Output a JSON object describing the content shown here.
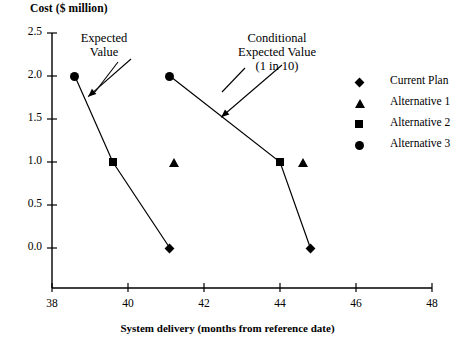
{
  "chart_data": {
    "type": "line",
    "title": "",
    "xlabel": "System delivery (months from reference date)",
    "ylabel": "Cost ($ million)",
    "xlim": [
      38,
      48
    ],
    "ylim": [
      0.0,
      2.5
    ],
    "xticks": [
      38,
      40,
      42,
      44,
      46,
      48
    ],
    "yticks": [
      "0.0",
      "0.5",
      "1.0",
      "1.5",
      "2.0",
      "2.5"
    ],
    "ytick_values": [
      0.0,
      0.5,
      1.0,
      1.5,
      2.0,
      2.5
    ],
    "grid": false,
    "legend_position": "right",
    "legend": [
      {
        "label": "Current Plan",
        "marker": "diamond"
      },
      {
        "label": "Alternative 1",
        "marker": "triangle"
      },
      {
        "label": "Alternative 2",
        "marker": "square"
      },
      {
        "label": "Alternative 3",
        "marker": "circle"
      }
    ],
    "series": [
      {
        "name": "Expected Value",
        "points": [
          {
            "x": 38.6,
            "y": 2.0,
            "marker": "circle",
            "label": "Alternative 3"
          },
          {
            "x": 39.6,
            "y": 1.0,
            "marker": "square",
            "label": "Alternative 2"
          },
          {
            "x": 41.1,
            "y": 0.0,
            "marker": "diamond",
            "label": "Current Plan"
          }
        ]
      },
      {
        "name": "Conditional Expected Value (1 in 10)",
        "points": [
          {
            "x": 41.1,
            "y": 2.0,
            "marker": "circle",
            "label": "Alternative 3"
          },
          {
            "x": 44.0,
            "y": 1.0,
            "marker": "square",
            "label": "Alternative 2"
          },
          {
            "x": 44.8,
            "y": 0.0,
            "marker": "diamond",
            "label": "Current Plan"
          }
        ]
      }
    ],
    "standalone_points": [
      {
        "x": 41.2,
        "y": 1.0,
        "marker": "triangle",
        "label": "Alternative 1"
      },
      {
        "x": 44.6,
        "y": 1.0,
        "marker": "triangle",
        "label": "Alternative 1"
      }
    ],
    "annotations": [
      {
        "id": "expected-value",
        "lines": [
          "Expected",
          "Value"
        ],
        "target_x": 38.95,
        "target_y": 1.76
      },
      {
        "id": "conditional-expected-value",
        "lines": [
          "Conditional",
          "Expected Value",
          "(1 in 10)"
        ],
        "target_x": 42.45,
        "target_y": 1.52
      }
    ]
  },
  "annotations_text": {
    "expected_value": {
      "line1": "Expected",
      "line2": "Value"
    },
    "conditional_expected_value": {
      "line1": "Conditional",
      "line2": "Expected Value",
      "line3": "(1 in 10)"
    }
  }
}
